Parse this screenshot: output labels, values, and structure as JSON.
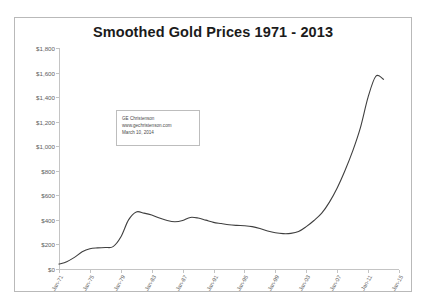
{
  "chart_data": {
    "type": "line",
    "title": "Smoothed Gold Prices 1971 - 2013",
    "xlabel": "",
    "ylabel": "",
    "ylim": [
      0,
      1800
    ],
    "ytick_values": [
      0,
      200,
      400,
      600,
      800,
      1000,
      1200,
      1400,
      1600,
      1800
    ],
    "ytick_labels": [
      "$0",
      "$200",
      "$400",
      "$600",
      "$800",
      "$1,000",
      "$1,200",
      "$1,400",
      "$1,600",
      "$1,800"
    ],
    "xlim": [
      1971,
      2015
    ],
    "xtick_values": [
      1971,
      1975,
      1979,
      1983,
      1987,
      1991,
      1995,
      1999,
      2003,
      2007,
      2011,
      2015
    ],
    "xtick_labels": [
      "Jan-71",
      "Jan-75",
      "Jan-79",
      "Jan-83",
      "Jan-87",
      "Jan-91",
      "Jan-95",
      "Jan-99",
      "Jan-03",
      "Jan-07",
      "Jan-11",
      "Jan-15"
    ],
    "grid": false,
    "legend": false,
    "line_color": "#3f3f3f",
    "series": [
      {
        "name": "Smoothed Gold Price",
        "x": [
          1971,
          1972,
          1973,
          1974,
          1975,
          1976,
          1977,
          1978,
          1979,
          1980,
          1981,
          1982,
          1983,
          1984,
          1985,
          1986,
          1987,
          1988,
          1989,
          1990,
          1991,
          1992,
          1993,
          1994,
          1995,
          1996,
          1997,
          1998,
          1999,
          2000,
          2001,
          2002,
          2003,
          2004,
          2005,
          2006,
          2007,
          2008,
          2009,
          2010,
          2011,
          2012,
          2013
        ],
        "values": [
          40,
          60,
          95,
          140,
          165,
          172,
          175,
          182,
          260,
          400,
          465,
          455,
          440,
          415,
          395,
          385,
          395,
          420,
          415,
          398,
          380,
          370,
          360,
          355,
          352,
          345,
          330,
          310,
          295,
          288,
          290,
          305,
          345,
          395,
          455,
          545,
          660,
          800,
          960,
          1150,
          1400,
          1570,
          1545
        ]
      }
    ]
  },
  "annotation": {
    "lines": [
      "GE Christenson",
      "www.gechristenson.com",
      "March 10, 2014"
    ]
  }
}
